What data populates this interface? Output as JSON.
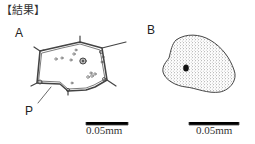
{
  "heading": "【結果】",
  "figures": [
    {
      "label": "A",
      "description": "Cell with thin cell wall, nucleus, and small granules; pointer line labeled P",
      "pointer_label": "P",
      "scale_bar": "0.05mm"
    },
    {
      "label": "B",
      "description": "Stippled irregular cell with dark nucleus",
      "scale_bar": "0.05mm"
    }
  ],
  "colors": {
    "line": "#444444",
    "stipple": "#555555",
    "nucleus": "#111111"
  }
}
